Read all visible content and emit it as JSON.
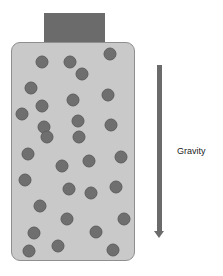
{
  "diagram": {
    "label": "Gravity",
    "colors": {
      "cap": "#6b6b6b",
      "container_fill": "#c9c9c9",
      "container_border": "#8f8f8f",
      "particle": "#6f6f6f",
      "arrow": "#6b6b6b"
    },
    "particles": [
      [
        42,
        62
      ],
      [
        70,
        62
      ],
      [
        110,
        54
      ],
      [
        82,
        74
      ],
      [
        31,
        88
      ],
      [
        108,
        95
      ],
      [
        73,
        100
      ],
      [
        42,
        106
      ],
      [
        22,
        114
      ],
      [
        78,
        121
      ],
      [
        44,
        127
      ],
      [
        111,
        125
      ],
      [
        47,
        137
      ],
      [
        79,
        137
      ],
      [
        28,
        154
      ],
      [
        89,
        161
      ],
      [
        121,
        157
      ],
      [
        62,
        166
      ],
      [
        25,
        180
      ],
      [
        69,
        189
      ],
      [
        91,
        193
      ],
      [
        116,
        187
      ],
      [
        40,
        206
      ],
      [
        67,
        219
      ],
      [
        124,
        219
      ],
      [
        34,
        233
      ],
      [
        96,
        232
      ],
      [
        29,
        251
      ],
      [
        58,
        246
      ],
      [
        113,
        250
      ]
    ]
  }
}
